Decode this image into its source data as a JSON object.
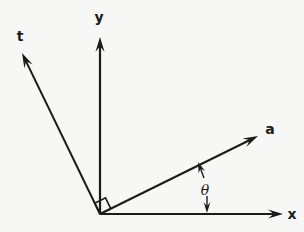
{
  "figure": {
    "kind": "vector-axis-diagram",
    "width": 304,
    "height": 232,
    "background_color": "#f7f7f5",
    "stroke_color": "#1b1b1b"
  },
  "chart_data": {
    "type": "scatter",
    "title": "",
    "xlabel": "x",
    "ylabel": "y",
    "grid": false,
    "legend": null,
    "origin": {
      "x": 100,
      "y": 214
    },
    "axes": [
      {
        "name": "y-axis",
        "label": "y",
        "from": {
          "x": 100,
          "y": 214
        },
        "to": {
          "x": 100,
          "y": 37
        },
        "arrowhead": true,
        "label_pos": {
          "x": 99,
          "y": 17
        }
      },
      {
        "name": "x-axis",
        "label": "x",
        "from": {
          "x": 100,
          "y": 214
        },
        "to": {
          "x": 283,
          "y": 214
        },
        "arrowhead": true,
        "label_pos": {
          "x": 292,
          "y": 214
        }
      },
      {
        "name": "t-axis",
        "label": "t",
        "from": {
          "x": 100,
          "y": 214
        },
        "to": {
          "x": 22,
          "y": 53
        },
        "arrowhead": true,
        "label_pos": {
          "x": 20,
          "y": 36
        }
      }
    ],
    "vectors": [
      {
        "name": "a-vector",
        "label": "a",
        "from": {
          "x": 100,
          "y": 214
        },
        "to": {
          "x": 258,
          "y": 136
        },
        "arrowhead": true,
        "label_pos": {
          "x": 270,
          "y": 129
        }
      }
    ],
    "annotations": [
      {
        "name": "theta-angle",
        "label": "θ",
        "label_pos": {
          "x": 205,
          "y": 190
        },
        "measure_between": [
          "a-vector",
          "x-axis"
        ],
        "upper_arrow": {
          "from": {
            "x": 204,
            "y": 178
          },
          "to": {
            "x": 198,
            "y": 162
          }
        },
        "lower_arrow": {
          "from": {
            "x": 207,
            "y": 196
          },
          "to": {
            "x": 207,
            "y": 213
          }
        }
      },
      {
        "name": "right-angle-marker",
        "label": "",
        "between": [
          "t-axis",
          "a-vector"
        ],
        "vertex": {
          "x": 100,
          "y": 214
        },
        "size": 12
      }
    ]
  },
  "labels": {
    "t_axis": "t",
    "y_axis": "y",
    "x_axis": "x",
    "a_vector": "a",
    "theta": "θ"
  }
}
